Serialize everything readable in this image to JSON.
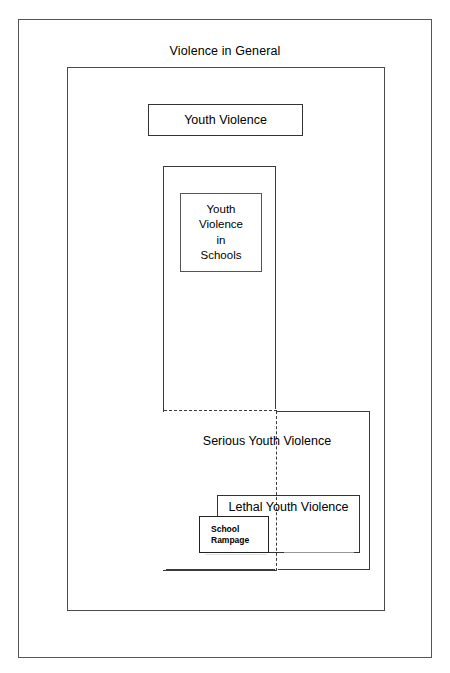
{
  "diagram": {
    "title": "Violence in General",
    "type": "nested-venn-boxes",
    "background_color": "#ffffff",
    "line_color": "#333333",
    "regions": [
      {
        "id": "violence-in-general",
        "label": "Violence in General",
        "level": 0,
        "border_style": "solid",
        "label_position": "above-top-edge"
      },
      {
        "id": "youth-violence",
        "label": "Youth Violence",
        "level": 1,
        "border_style": "solid",
        "label_position": "center"
      },
      {
        "id": "youth-violence-in-schools-column",
        "label": "",
        "level": 2,
        "border_style": "solid",
        "label_position": "none"
      },
      {
        "id": "youth-violence-in-schools",
        "label": "Youth\nViolence\nin\nSchools",
        "level": 3,
        "border_style": "solid",
        "label_position": "center"
      },
      {
        "id": "serious-youth-violence",
        "label": "Serious Youth Violence",
        "level": 2,
        "border_style": "solid-with-dashed-overlap",
        "label_position": "top-center"
      },
      {
        "id": "lethal-youth-violence",
        "label": "Lethal Youth Violence",
        "level": 3,
        "border_style": "solid",
        "label_position": "top-center"
      },
      {
        "id": "school-rampage",
        "label": "School\nRampage",
        "level": 4,
        "border_style": "solid",
        "label_position": "center-left"
      }
    ]
  },
  "labels": {
    "violence_in_general": "Violence in General",
    "youth_violence": "Youth Violence",
    "youth_violence_in_schools": "Youth\nViolence\nin\nSchools",
    "serious_youth_violence": "Serious Youth Violence",
    "lethal_youth_violence": "Lethal Youth Violence",
    "school_rampage": "School\nRampage"
  }
}
